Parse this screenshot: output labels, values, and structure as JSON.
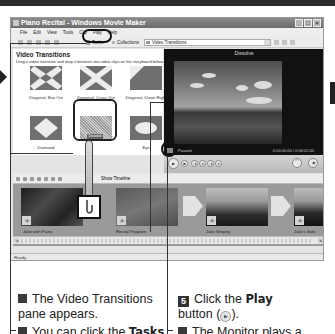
{
  "window": {
    "title": "Piano Recital - Windows Movie Maker",
    "controls": [
      "_",
      "□",
      "×"
    ]
  },
  "menu": [
    "File",
    "Edit",
    "View",
    "Tools",
    "Clip",
    "Play",
    "Help"
  ],
  "toolbar": {
    "tasks_label": "Tasks",
    "collections_label": "Collections",
    "collection_select_value": "Video Transitions"
  },
  "collection_pane": {
    "title": "Video Transitions",
    "description": "Drag a video transition and drop it between two video clips on the storyboard below.",
    "tiles": [
      {
        "label": "Diagonal, Box Out",
        "icon": "diagonal-box-out"
      },
      {
        "label": "Diagonal, Cross Out",
        "icon": "diagonal-cross-out"
      },
      {
        "label": "Diagonal, Down Right",
        "icon": "diagonal-down-right"
      },
      {
        "label": "Diamond",
        "icon": "diamond"
      },
      {
        "label": "Dissolve",
        "icon": "dissolve",
        "selected": true
      },
      {
        "label": "Eye",
        "icon": "eye"
      }
    ]
  },
  "monitor": {
    "title": "Dissolve",
    "status": "Paused",
    "timecode": "0:00:00.00 / 0:00:02.00"
  },
  "storyboard": {
    "timeline_label": "Show Timeline",
    "clips": [
      {
        "label": "Jake with Piano"
      },
      {
        "label": "Recital Program"
      },
      {
        "label": "Jake Singing"
      },
      {
        "label": "Jake's Solo"
      }
    ]
  },
  "statusbar": {
    "text": "Ready"
  },
  "captions": {
    "left_bullet1": "The Video Transitions pane appears.",
    "left_bullet2_prefix": "You can click the ",
    "left_bullet2_bold": "Tasks",
    "right_step_number": "5",
    "right_step_prefix": "Click the ",
    "right_step_bold": "Play",
    "right_step_suffix_a": "button (",
    "right_step_suffix_b": ").",
    "right_bullet_prefix": "The Monitor plays a"
  }
}
